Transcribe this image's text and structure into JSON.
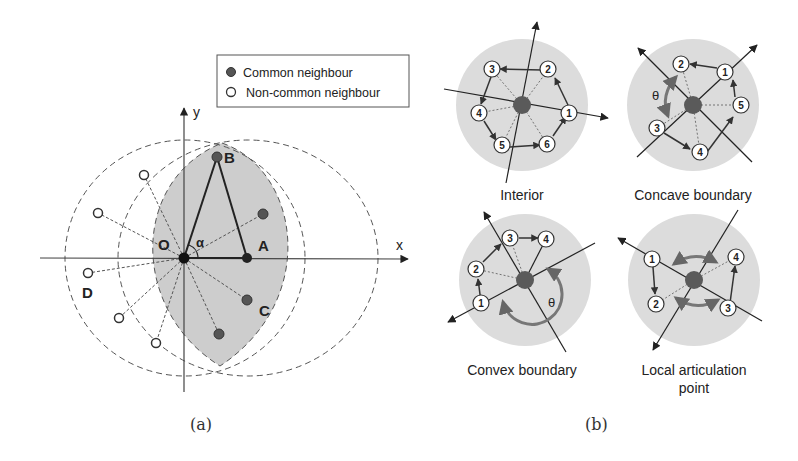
{
  "panel_a": {
    "caption": "(a)",
    "legend": {
      "items": [
        {
          "label": "Common neighbour",
          "marker": "filled-circle"
        },
        {
          "label": "Non-common neighbour",
          "marker": "hollow-circle"
        }
      ]
    },
    "axes": {
      "x_label": "x",
      "y_label": "y"
    },
    "points": {
      "O": "O",
      "A": "A",
      "B": "B",
      "C": "C",
      "D": "D"
    },
    "angle_label": "α"
  },
  "panel_b": {
    "caption": "(b)",
    "subfigures": [
      {
        "title": "Interior",
        "nodes": [
          "1",
          "2",
          "3",
          "4",
          "5",
          "6"
        ]
      },
      {
        "title": "Concave boundary",
        "nodes": [
          "1",
          "2",
          "3",
          "4",
          "5"
        ],
        "angle_label": "θ"
      },
      {
        "title": "Convex boundary",
        "nodes": [
          "1",
          "2",
          "3",
          "4"
        ],
        "angle_label": "θ"
      },
      {
        "title_line1": "Local articulation",
        "title_line2": "point",
        "nodes": [
          "1",
          "2",
          "3",
          "4"
        ]
      }
    ]
  },
  "colors": {
    "shade": "#cfcfcf",
    "disk": "#dcdcdc",
    "node_fill": "#5a5a5a",
    "line": "#333333"
  }
}
